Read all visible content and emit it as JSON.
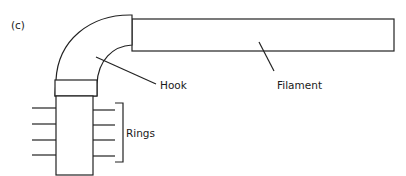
{
  "figure": {
    "panel_label": "(c)",
    "labels": {
      "hook": "Hook",
      "filament": "Filament",
      "rings": "Rings"
    },
    "colors": {
      "line": "#222222",
      "background": "#ffffff",
      "text": "#1a1a1a"
    },
    "parts": [
      {
        "name": "filament",
        "shape": "rectangle"
      },
      {
        "name": "hook",
        "shape": "curved elbow"
      },
      {
        "name": "basal-body-rod",
        "shape": "rectangle"
      },
      {
        "name": "rings",
        "count": 4,
        "shape": "paired horizontal lines"
      }
    ]
  }
}
